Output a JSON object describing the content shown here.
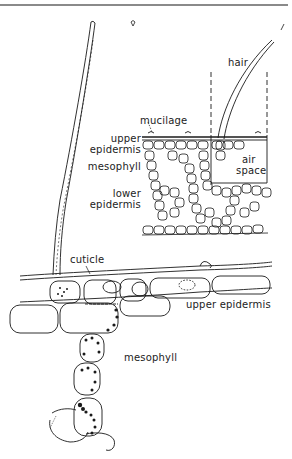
{
  "figure": {
    "type": "plant leaf cross-section diagram",
    "inset_labels": {
      "hair": "hair",
      "mucilage": "mucilage",
      "upper_epidermis": [
        "upper",
        "epidermis"
      ],
      "mesophyll": "mesophyll",
      "lower_epidermis": [
        "lower",
        "epidermis"
      ],
      "air_space": [
        "air",
        "space"
      ]
    },
    "detail_labels": {
      "cuticle": "cuticle",
      "upper_epidermis": "upper epidermis",
      "mesophyll": "mesophyll"
    }
  },
  "colors": {
    "line": "#1a1a1a",
    "background": "#ffffff",
    "top_rule": "#8a8a8a"
  }
}
